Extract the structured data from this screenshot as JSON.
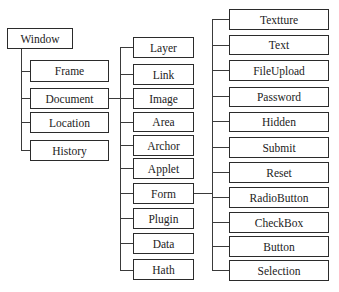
{
  "diagram": {
    "title": "",
    "root": {
      "label": "Window"
    },
    "level1": [
      {
        "label": "Frame"
      },
      {
        "label": "Document"
      },
      {
        "label": "Location"
      },
      {
        "label": "History"
      }
    ],
    "document_children": [
      {
        "label": "Layer"
      },
      {
        "label": "Link"
      },
      {
        "label": "Image"
      },
      {
        "label": "Area"
      },
      {
        "label": "Archor"
      },
      {
        "label": "Applet"
      },
      {
        "label": "Form"
      },
      {
        "label": "Plugin"
      },
      {
        "label": "Data"
      },
      {
        "label": "Hath"
      }
    ],
    "form_children": [
      {
        "label": "Textture"
      },
      {
        "label": "Text"
      },
      {
        "label": "FileUpload"
      },
      {
        "label": "Password"
      },
      {
        "label": "Hidden"
      },
      {
        "label": "Submit"
      },
      {
        "label": "Reset"
      },
      {
        "label": "RadioButton"
      },
      {
        "label": "CheckBox"
      },
      {
        "label": "Button"
      },
      {
        "label": "Selection"
      }
    ],
    "edges": [
      {
        "from": "Window",
        "to": [
          "Frame",
          "Document",
          "Location",
          "History"
        ]
      },
      {
        "from": "Document",
        "to": [
          "Layer",
          "Link",
          "Image",
          "Area",
          "Archor",
          "Applet",
          "Form",
          "Plugin",
          "Data",
          "Hath"
        ]
      },
      {
        "from": "Form",
        "to": [
          "Textture",
          "Text",
          "FileUpload",
          "Password",
          "Hidden",
          "Submit",
          "Reset",
          "RadioButton",
          "CheckBox",
          "Button",
          "Selection"
        ]
      }
    ],
    "colors": {
      "line": "#2b2b2b",
      "box_fill": "#ffffff",
      "text": "#222222"
    }
  }
}
